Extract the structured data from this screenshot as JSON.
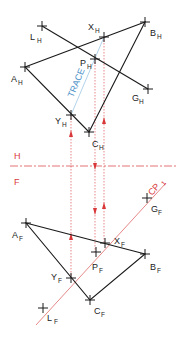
{
  "colors": {
    "object": "#1a1a1a",
    "construction": "#d9383a",
    "trace": "#4a90c8",
    "background": "#ffffff"
  },
  "fold_line": {
    "upper_label": "H",
    "lower_label": "F",
    "y": 166
  },
  "cutting_plane": {
    "label": "CP",
    "subscript": "1"
  },
  "trace_label": "TRACE",
  "top_view": {
    "points": [
      {
        "name": "L",
        "sub": "H",
        "x": 42,
        "y": 26
      },
      {
        "name": "X",
        "sub": "H",
        "x": 104,
        "y": 37
      },
      {
        "name": "B",
        "sub": "H",
        "x": 145,
        "y": 22
      },
      {
        "name": "P",
        "sub": "H",
        "x": 95,
        "y": 59
      },
      {
        "name": "A",
        "sub": "H",
        "x": 25,
        "y": 67
      },
      {
        "name": "G",
        "sub": "H",
        "x": 148,
        "y": 89
      },
      {
        "name": "Y",
        "sub": "H",
        "x": 71,
        "y": 115
      },
      {
        "name": "C",
        "sub": "H",
        "x": 89,
        "y": 132
      }
    ]
  },
  "front_view": {
    "points": [
      {
        "name": "G",
        "sub": "F",
        "x": 147,
        "y": 198
      },
      {
        "name": "A",
        "sub": "F",
        "x": 26,
        "y": 223
      },
      {
        "name": "X",
        "sub": "F",
        "x": 105,
        "y": 243
      },
      {
        "name": "P",
        "sub": "F",
        "x": 96,
        "y": 252
      },
      {
        "name": "B",
        "sub": "F",
        "x": 145,
        "y": 254
      },
      {
        "name": "Y",
        "sub": "F",
        "x": 71,
        "y": 278
      },
      {
        "name": "C",
        "sub": "F",
        "x": 90,
        "y": 300
      },
      {
        "name": "L",
        "sub": "F",
        "x": 43,
        "y": 308
      }
    ]
  }
}
